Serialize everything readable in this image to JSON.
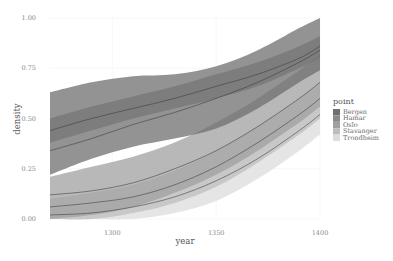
{
  "chart_data": {
    "type": "area",
    "title": "",
    "xlabel": "year",
    "ylabel": "density",
    "xlim": [
      1270,
      1400
    ],
    "ylim": [
      0,
      1.0
    ],
    "x_ticks": [
      1300,
      1350,
      1400
    ],
    "x_tick_labels": [
      "1300",
      "1350",
      "1400"
    ],
    "y_ticks": [
      0,
      0.25,
      0.5,
      0.75,
      1.0
    ],
    "y_tick_labels": [
      "0.00",
      "0.25",
      "0.50",
      "0.75",
      "1.00"
    ],
    "grid": true,
    "legend": {
      "title": "point",
      "position": "right",
      "entries": [
        "Bergen",
        "Hamar",
        "Oslo",
        "Stavanger",
        "Trondheim"
      ]
    },
    "x": [
      1270,
      1290,
      1310,
      1330,
      1350,
      1370,
      1390,
      1400
    ],
    "series": [
      {
        "name": "Bergen",
        "color": "#6f6f6f",
        "line": [
          0.34,
          0.4,
          0.47,
          0.53,
          0.6,
          0.68,
          0.78,
          0.84
        ],
        "lower": [
          0.22,
          0.3,
          0.36,
          0.4,
          0.45,
          0.55,
          0.68,
          0.74
        ],
        "upper": [
          0.63,
          0.68,
          0.71,
          0.72,
          0.76,
          0.84,
          0.95,
          1.0
        ]
      },
      {
        "name": "Hamar",
        "color": "#8a8a8a",
        "line": [
          0.44,
          0.5,
          0.55,
          0.6,
          0.66,
          0.72,
          0.8,
          0.86
        ],
        "lower": [
          0.38,
          0.44,
          0.5,
          0.55,
          0.6,
          0.66,
          0.75,
          0.8
        ],
        "upper": [
          0.5,
          0.56,
          0.61,
          0.66,
          0.72,
          0.78,
          0.86,
          0.91
        ]
      },
      {
        "name": "Oslo",
        "color": "#a0a0a0",
        "line": [
          0.12,
          0.14,
          0.18,
          0.25,
          0.34,
          0.46,
          0.6,
          0.68
        ],
        "lower": [
          0.0,
          0.02,
          0.06,
          0.13,
          0.22,
          0.34,
          0.48,
          0.56
        ],
        "upper": [
          0.21,
          0.26,
          0.31,
          0.38,
          0.48,
          0.6,
          0.74,
          0.82
        ]
      },
      {
        "name": "Stavanger",
        "color": "#bdbdbd",
        "line": [
          0.06,
          0.08,
          0.11,
          0.17,
          0.26,
          0.38,
          0.52,
          0.6
        ],
        "lower": [
          0.0,
          0.0,
          0.03,
          0.08,
          0.16,
          0.28,
          0.42,
          0.5
        ],
        "upper": [
          0.1,
          0.13,
          0.17,
          0.24,
          0.34,
          0.46,
          0.6,
          0.68
        ]
      },
      {
        "name": "Trondheim",
        "color": "#dcdcdc",
        "line": [
          0.02,
          0.03,
          0.06,
          0.11,
          0.19,
          0.3,
          0.44,
          0.52
        ],
        "lower": [
          0.0,
          0.0,
          0.0,
          0.03,
          0.09,
          0.2,
          0.34,
          0.42
        ],
        "upper": [
          0.05,
          0.07,
          0.11,
          0.17,
          0.26,
          0.38,
          0.52,
          0.6
        ]
      }
    ]
  }
}
